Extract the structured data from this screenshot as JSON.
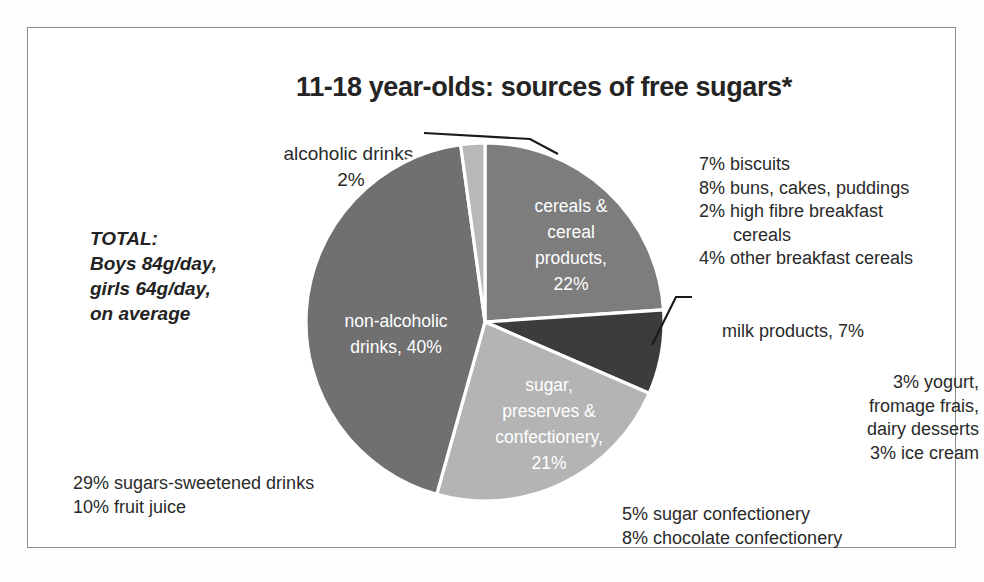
{
  "title": "11-18 year-olds: sources of free sugars*",
  "total_note": {
    "line1": "TOTAL:",
    "line2": "Boys 84g/day,",
    "line3": "girls 64g/day,",
    "line4": "on average"
  },
  "callouts": {
    "alcoholic": {
      "line1": "alcoholic drinks,",
      "line2": "2%"
    },
    "milk": "milk products, 7%"
  },
  "notes": {
    "cereal": [
      "7% biscuits",
      "8% buns, cakes, puddings",
      "2% high fibre breakfast",
      "cereals",
      "4% other breakfast cereals"
    ],
    "dairy": [
      "3% yogurt,",
      "fromage frais,",
      "dairy desserts",
      "3% ice cream"
    ],
    "drinks": [
      "29% sugars-sweetened drinks",
      "10% fruit juice"
    ],
    "confectionery": [
      "5% sugar confectionery",
      "8% chocolate confectionery"
    ]
  },
  "chart_data": {
    "type": "pie",
    "title": "11-18 year-olds: sources of free sugars*",
    "unit": "percent",
    "legend": "none",
    "total_percent": 92,
    "slices": [
      {
        "name": "cereals & cereal products",
        "value": 22,
        "color": "#7d7d7d",
        "label_lines": [
          "cereals &",
          "cereal",
          "products,",
          "22%"
        ],
        "label_x": 571,
        "label_y": 212
      },
      {
        "name": "milk products",
        "value": 7,
        "color": "#3c3c3c",
        "label_lines": [],
        "label_x": 0,
        "label_y": 0
      },
      {
        "name": "sugar, preserves & confectionery",
        "value": 21,
        "color": "#b4b4b4",
        "label_lines": [
          "sugar,",
          "preserves &",
          "confectionery,",
          "21%"
        ],
        "label_x": 549,
        "label_y": 391
      },
      {
        "name": "non-alcoholic drinks",
        "value": 40,
        "color": "#707070",
        "label_lines": [
          "non-alcoholic",
          "drinks, 40%"
        ],
        "label_x": 396,
        "label_y": 327
      },
      {
        "name": "alcoholic drinks",
        "value": 2,
        "color": "#b8b8b8",
        "label_lines": [],
        "label_x": 0,
        "label_y": 0
      }
    ]
  }
}
